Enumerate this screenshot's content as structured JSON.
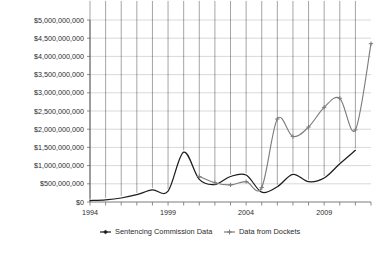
{
  "chart_data": {
    "type": "line",
    "title": "",
    "xlabel": "",
    "ylabel": "",
    "ylim": [
      0,
      5000000000
    ],
    "xlim": [
      1994,
      2012
    ],
    "grid": true,
    "legend_position": "bottom",
    "y_tick_labels": [
      "$5,000,000,000",
      "$4,500,000,000",
      "$4,000,000,000",
      "$3,500,000,000",
      "$3,000,000,000",
      "$2,500,000,000",
      "$2,000,000,000",
      "$1,500,000,000",
      "$1,000,000,000",
      "$500,000,000",
      "$0"
    ],
    "y_tick_values": [
      5000000000,
      4500000000,
      4000000000,
      3500000000,
      3000000000,
      2500000000,
      2000000000,
      1500000000,
      1000000000,
      500000000,
      0
    ],
    "x_tick_labels": [
      "1994",
      "1999",
      "2004",
      "2009"
    ],
    "x_tick_values": [
      1994,
      1999,
      2004,
      2009
    ],
    "x_all_years": [
      1994,
      1995,
      1996,
      1997,
      1998,
      1999,
      2000,
      2001,
      2002,
      2003,
      2004,
      2005,
      2006,
      2007,
      2008,
      2009,
      2010,
      2011,
      2012
    ],
    "series": [
      {
        "name": "Sentencing Commission Data",
        "color": "#1c1c1c",
        "marker": "diamond",
        "x": [
          1994,
          1995,
          1996,
          1997,
          1998,
          1999,
          2000,
          2001,
          2002,
          2003,
          2004,
          2005,
          2006,
          2007,
          2008,
          2009,
          2010,
          2011
        ],
        "values": [
          40000000,
          60000000,
          110000000,
          200000000,
          330000000,
          300000000,
          1370000000,
          620000000,
          480000000,
          700000000,
          740000000,
          270000000,
          420000000,
          760000000,
          560000000,
          660000000,
          1050000000,
          1420000000
        ]
      },
      {
        "name": "Data from Dockets",
        "color": "#7d7d7d",
        "marker": "star",
        "x": [
          2001,
          2002,
          2003,
          2004,
          2005,
          2006,
          2007,
          2008,
          2009,
          2010,
          2011,
          2012
        ],
        "values": [
          700000000,
          530000000,
          470000000,
          560000000,
          400000000,
          2280000000,
          1800000000,
          2060000000,
          2600000000,
          2850000000,
          1980000000,
          4350000000
        ]
      }
    ]
  },
  "legend": {
    "items": [
      {
        "label": "Sentencing Commission Data",
        "color": "#1c1c1c"
      },
      {
        "label": "Data from Dockets",
        "color": "#7d7d7d"
      }
    ]
  }
}
